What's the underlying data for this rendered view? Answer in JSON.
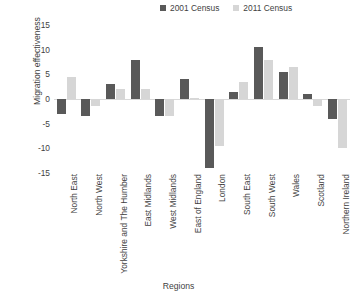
{
  "chart_data": {
    "type": "bar",
    "title": "",
    "xlabel": "Regions",
    "ylabel": "Migration effectiveness",
    "ylim": [
      -15,
      15
    ],
    "yticks": [
      15,
      10,
      5,
      0,
      -5,
      -10,
      -15
    ],
    "grid": false,
    "legend_position": "top-right",
    "categories": [
      "North East",
      "North West",
      "Yorkshire and The Humber",
      "East Midlands",
      "West Midlands",
      "East of England",
      "London",
      "South East",
      "South West",
      "Wales",
      "Scotland",
      "Northern Ireland"
    ],
    "series": [
      {
        "name": "2001 Census",
        "color": "#595959",
        "values": [
          -3.0,
          -3.5,
          3.0,
          8.0,
          -3.5,
          4.0,
          -14.0,
          1.5,
          10.5,
          5.5,
          1.0,
          -4.0
        ]
      },
      {
        "name": "2011 Census",
        "color": "#d6d6d6",
        "values": [
          4.5,
          -1.5,
          2.0,
          2.0,
          -3.5,
          0.2,
          -9.5,
          3.5,
          8.0,
          6.5,
          -1.5,
          -10.0
        ]
      }
    ]
  },
  "legend": {
    "entries": [
      {
        "label": "2001 Census",
        "color": "#595959"
      },
      {
        "label": "2011 Census",
        "color": "#d6d6d6"
      }
    ]
  },
  "axes": {
    "y_title": "Migration effectiveness",
    "x_title": "Regions"
  }
}
